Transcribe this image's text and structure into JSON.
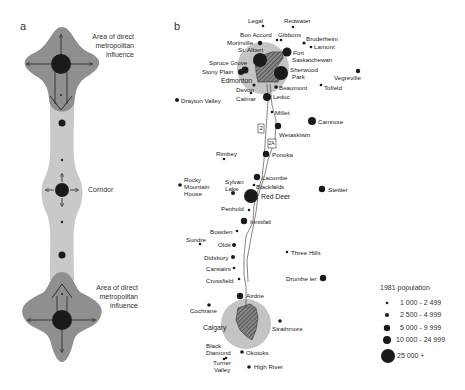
{
  "panels": {
    "a": {
      "label": "a",
      "annotations": {
        "top": [
          "Area of direct",
          "metropolitan",
          "influence"
        ],
        "middle": "Corridor",
        "bottom": [
          "Area of direct",
          "metropolitan",
          "influence"
        ]
      }
    },
    "b": {
      "label": "b",
      "highways": [
        "2",
        "2A"
      ]
    }
  },
  "places": [
    {
      "name": "Legal",
      "size": 1
    },
    {
      "name": "Redwater",
      "size": 1
    },
    {
      "name": "Bon Accord",
      "size": 1
    },
    {
      "name": "Gibbons",
      "size": 1
    },
    {
      "name": "Bruderheim",
      "size": 1
    },
    {
      "name": "Morinville",
      "size": 2
    },
    {
      "name": "Lamont",
      "size": 1
    },
    {
      "name": "St. Albert",
      "size": 5
    },
    {
      "name": "Fort Saskatchewan",
      "size": 4
    },
    {
      "name": "Spruce Grove",
      "size": 3
    },
    {
      "name": "Stony Plain",
      "size": 3
    },
    {
      "name": "Sherwood Park",
      "size": 5
    },
    {
      "name": "Vegreville",
      "size": 2
    },
    {
      "name": "Edmonton",
      "size": 5
    },
    {
      "name": "Devon",
      "size": 1
    },
    {
      "name": "Beaumont",
      "size": 2
    },
    {
      "name": "Tofield",
      "size": 1
    },
    {
      "name": "Calmar",
      "size": 1
    },
    {
      "name": "Leduc",
      "size": 4
    },
    {
      "name": "Drayton Valley",
      "size": 2
    },
    {
      "name": "Millet",
      "size": 1
    },
    {
      "name": "Camrose",
      "size": 4
    },
    {
      "name": "Wetaskiwin",
      "size": 3
    },
    {
      "name": "Rimbey",
      "size": 1
    },
    {
      "name": "Ponoka",
      "size": 3
    },
    {
      "name": "Rocky Mountain House",
      "size": 2
    },
    {
      "name": "Lacombe",
      "size": 3
    },
    {
      "name": "Sylvan Lake",
      "size": 2
    },
    {
      "name": "Blackfalds",
      "size": 1
    },
    {
      "name": "Red Deer",
      "size": 5
    },
    {
      "name": "Stettler",
      "size": 3
    },
    {
      "name": "Penhold",
      "size": 1
    },
    {
      "name": "Innisfail",
      "size": 3
    },
    {
      "name": "Bowden",
      "size": 1
    },
    {
      "name": "Sundre",
      "size": 1
    },
    {
      "name": "Olds",
      "size": 2
    },
    {
      "name": "Three Hills",
      "size": 1
    },
    {
      "name": "Didsbury",
      "size": 2
    },
    {
      "name": "Carstairs",
      "size": 1
    },
    {
      "name": "Drumheller",
      "size": 3
    },
    {
      "name": "Crossfield",
      "size": 1
    },
    {
      "name": "Airdrie",
      "size": 3
    },
    {
      "name": "Cochrane",
      "size": 2
    },
    {
      "name": "Calgary",
      "size": 5
    },
    {
      "name": "Strathmore",
      "size": 2
    },
    {
      "name": "Black Diamond",
      "size": 1
    },
    {
      "name": "Okotoks",
      "size": 2
    },
    {
      "name": "Turner Valley",
      "size": 1
    },
    {
      "name": "High River",
      "size": 2
    }
  ],
  "labels": {
    "legal": "Legal",
    "redwater": "Redwater",
    "bon_accord": "Bon Accord",
    "gibbons": "Gibbons",
    "bruderheim": "Bruderheim",
    "morinville": "Morinville",
    "lamont": "Lamont",
    "st_albert": "St. Albert",
    "fort": "Fort",
    "saskatchewan": "Saskatchewan",
    "spruce_grove": "Spruce Grove",
    "stony_plain": "Stony Plain",
    "sherwood": "Sherwood",
    "park": "Park",
    "vegreville": "Vegreville",
    "edmonton": "Edmonton",
    "devon": "Devon",
    "beaumont": "Beaumont",
    "tofield": "Tofield",
    "calmar": "Calmar",
    "leduc": "Leduc",
    "drayton_valley": "Drayton Valley",
    "millet": "Millet",
    "camrose": "Camrose",
    "wetaskiwin": "Wetaskiwin",
    "rimbey": "Rimbey",
    "ponoka": "Ponoka",
    "rocky": "Rocky",
    "mountain": "Mountain",
    "house": "House",
    "lacombe": "Lacombe",
    "sylvan": "Sylvan",
    "lake": "Lake",
    "blackfalds": "Blackfalds",
    "red_deer": "Red Deer",
    "stettler": "Stettler",
    "penhold": "Penhold",
    "innisfail": "Innisfail",
    "bowden": "Bowden",
    "sundre": "Sundre",
    "olds": "Olds",
    "three_hills": "Three Hills",
    "didsbury": "Didsbury",
    "carstairs": "Carstairs",
    "drumheller": "Drumhe ler",
    "crossfield": "Crossfield",
    "airdrie": "Airdrie",
    "cochrane": "Cochrane",
    "calgary": "Calgary",
    "strathmore": "Strathmore",
    "black": "Black",
    "diamond": "Diamond",
    "okotoks": "Okotoks",
    "turner": "Turner",
    "valley": "Valley",
    "high_river": "High River",
    "hwy2": "2",
    "hwy2a": "2A"
  },
  "legend": {
    "title": "1981 population",
    "items": [
      {
        "label": "1 000 - 2 499",
        "size": 1
      },
      {
        "label": "2 500 - 4 999",
        "size": 2
      },
      {
        "label": "5 000 - 9 999",
        "size": 3
      },
      {
        "label": "10 000 - 24 999",
        "size": 4
      },
      {
        "label": "25 000 +",
        "size": 5
      }
    ]
  },
  "colors": {
    "metro_area": "#8f8f8f",
    "corridor": "#c9c9c9",
    "influence_circle": "#c4c4c4",
    "dot": "#1a1a1a",
    "text": "#222222"
  }
}
